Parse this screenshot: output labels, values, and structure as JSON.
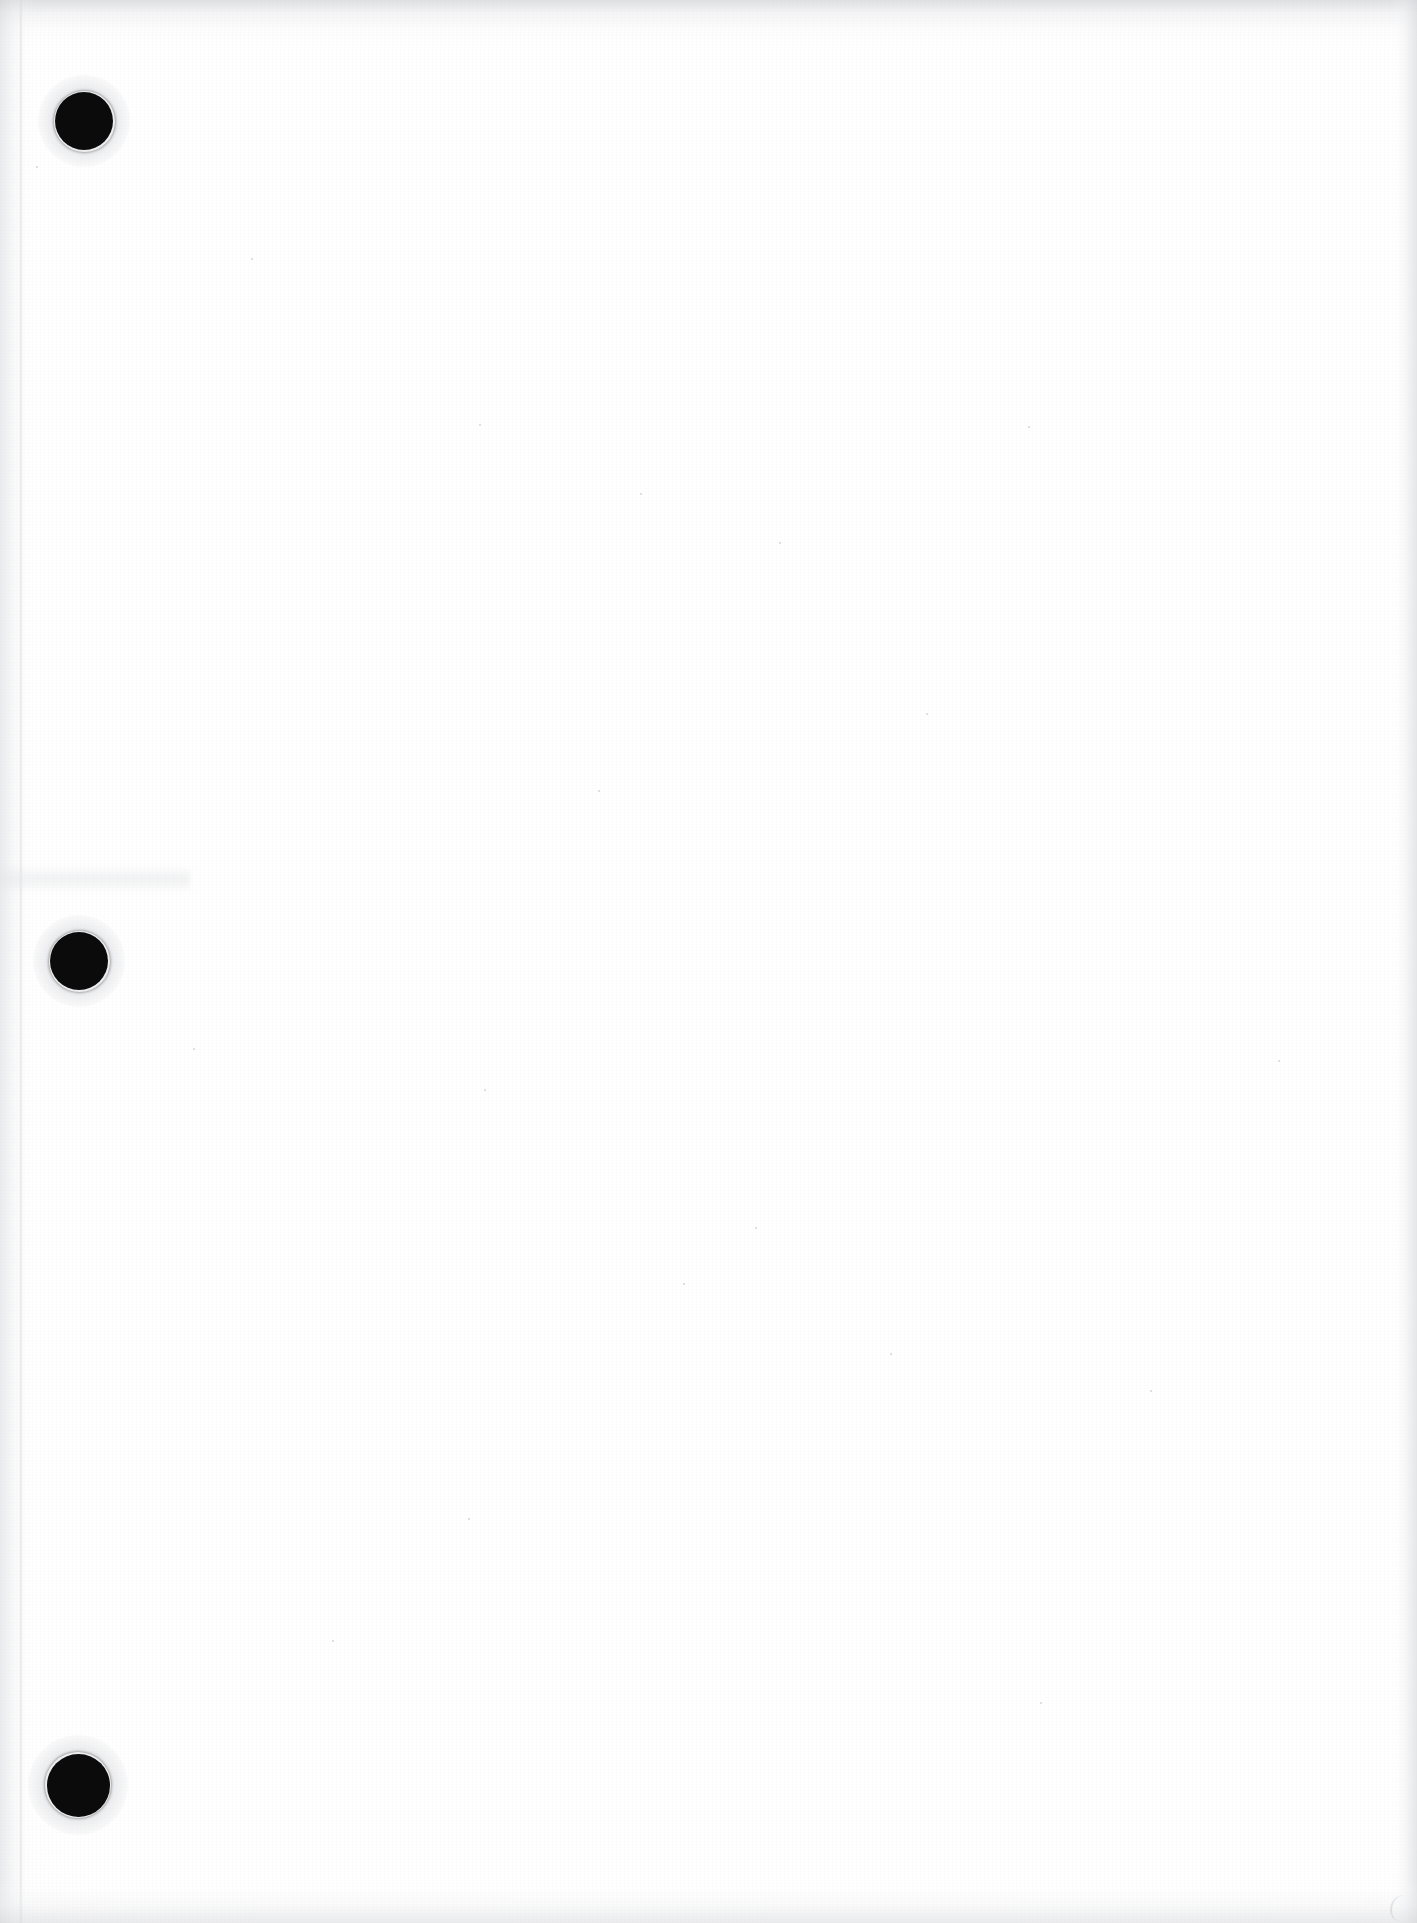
{
  "document": {
    "type": "scanned-page",
    "title": "Scanned blank page",
    "description": "Blank white scanned paper sheet with three punched binder holes along the left margin",
    "body_text": "",
    "page_width": 1417,
    "page_height": 1923,
    "background_color": "#ffffff",
    "ink_color": "#0b0b0b",
    "edge_shadow_color": "#d5d6d9"
  },
  "binder_holes": [
    {
      "label": "Top binder hole",
      "center_x": 84,
      "center_y": 121,
      "diameter": 58
    },
    {
      "label": "Middle binder hole",
      "center_x": 79,
      "center_y": 961,
      "diameter": 58
    },
    {
      "label": "Bottom binder hole",
      "center_x": 78,
      "center_y": 1785,
      "diameter": 63
    }
  ],
  "scan_artifacts": [
    {
      "label": "Top edge shadow band"
    },
    {
      "label": "Left edge shadow band"
    },
    {
      "label": "Left margin seam line"
    },
    {
      "label": "Right edge cut strip"
    },
    {
      "label": "Bottom edge shadow band"
    },
    {
      "label": "Mid-left smudge"
    },
    {
      "label": "Bottom-right curved mark"
    }
  ],
  "specks": [
    {
      "x": 36,
      "y": 166,
      "size": 2
    },
    {
      "x": 251,
      "y": 258,
      "size": 2
    },
    {
      "x": 479,
      "y": 424,
      "size": 2
    },
    {
      "x": 640,
      "y": 493,
      "size": 2
    },
    {
      "x": 1028,
      "y": 426,
      "size": 2
    },
    {
      "x": 779,
      "y": 542,
      "size": 2
    },
    {
      "x": 926,
      "y": 713,
      "size": 2
    },
    {
      "x": 193,
      "y": 1048,
      "size": 2
    },
    {
      "x": 484,
      "y": 1089,
      "size": 2
    },
    {
      "x": 755,
      "y": 1227,
      "size": 2
    },
    {
      "x": 683,
      "y": 1283,
      "size": 2
    },
    {
      "x": 890,
      "y": 1353,
      "size": 2
    },
    {
      "x": 468,
      "y": 1518,
      "size": 2
    },
    {
      "x": 1150,
      "y": 1390,
      "size": 2
    },
    {
      "x": 1278,
      "y": 1060,
      "size": 2
    },
    {
      "x": 332,
      "y": 1640,
      "size": 2
    },
    {
      "x": 1040,
      "y": 1702,
      "size": 2
    },
    {
      "x": 598,
      "y": 790,
      "size": 2
    }
  ]
}
